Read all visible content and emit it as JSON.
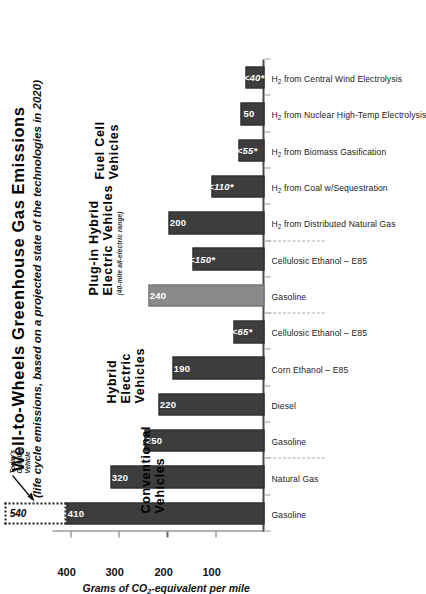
{
  "chart_data": {
    "type": "bar",
    "title": "Well-to-Wheels Greenhouse Gas Emissions",
    "subtitle": "(life cycle emissions, based on a projected state of the technologies in 2020)",
    "xlabel": "",
    "ylabel": "Grams of CO2-equivalent per mile",
    "ylabel_pre": "Grams of CO",
    "ylabel_sub": "2",
    "ylabel_post": "-equivalent per mile",
    "ylim": [
      0,
      440
    ],
    "yticks": [
      100,
      200,
      300,
      400
    ],
    "ytick_labels": [
      "100",
      "200",
      "300",
      "400"
    ],
    "grid": false,
    "legend": "none",
    "orientation": "rotated-90",
    "categories": [
      "Gasoline",
      "Natural Gas",
      "Gasoline",
      "Diesel",
      "Corn Ethanol – E85",
      "Cellulosic Ethanol – E85",
      "Gasoline",
      "Cellulosic Ethanol – E85",
      "H2 from Distributed Natural Gas",
      "H2 from Coal w/Sequestration",
      "H2 from Biomass Gasification",
      "H2 from Nuclear High-Temp Electrolysis",
      "H2 from Central Wind Electrolysis"
    ],
    "values": [
      410,
      320,
      250,
      220,
      190,
      65,
      240,
      150,
      200,
      110,
      55,
      50,
      40
    ],
    "value_labels": [
      "410",
      "320",
      "250",
      "220",
      "190",
      "<65*",
      "240",
      "<150*",
      "200",
      "<110*",
      "<55*",
      "50",
      "<40*"
    ],
    "annotation_ghost": {
      "value": 540,
      "label": "540",
      "callout_line1": "Today's",
      "callout_line2": "Gasoline",
      "callout_line3": "Vehicle"
    },
    "groups": [
      {
        "label_lines": [
          "Conventional",
          "Vehicles"
        ],
        "note": "",
        "start": 0,
        "end": 1
      },
      {
        "label_lines": [
          "Hybrid",
          "Electric",
          "Vehicles"
        ],
        "note": "",
        "start": 2,
        "end": 5
      },
      {
        "label_lines": [
          "Plug-in Hybrid",
          "Electric Vehicles"
        ],
        "note": "(40-mile all-electric range)",
        "start": 6,
        "end": 7
      },
      {
        "label_lines": [
          "Fuel Cell",
          "Vehicles"
        ],
        "note": "",
        "start": 8,
        "end": 12
      }
    ]
  }
}
